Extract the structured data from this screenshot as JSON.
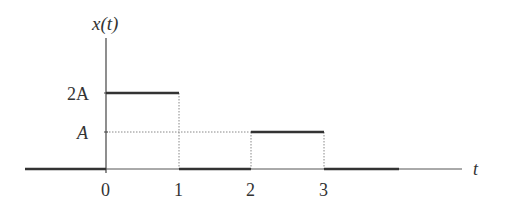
{
  "diagram": {
    "title": "x(t)",
    "y_axis_label": "x(t)",
    "x_axis_label": "t",
    "y_ticks": [
      {
        "label": "2A",
        "value": 2
      },
      {
        "label": "A",
        "value": 1
      }
    ],
    "x_ticks": [
      {
        "label": "0",
        "value": 0
      },
      {
        "label": "1",
        "value": 1
      },
      {
        "label": "2",
        "value": 2
      },
      {
        "label": "3",
        "value": 3
      }
    ],
    "signal_segments": [
      {
        "t_start": "-inf",
        "t_end": 0,
        "level": 0
      },
      {
        "t_start": 0,
        "t_end": 1,
        "level": "2A"
      },
      {
        "t_start": 1,
        "t_end": 2,
        "level": 0
      },
      {
        "t_start": 2,
        "t_end": 3,
        "level": "A"
      },
      {
        "t_start": 3,
        "t_end": "inf",
        "level": 0
      }
    ],
    "colors": {
      "line": "#333333",
      "dotted": "#888888"
    }
  }
}
